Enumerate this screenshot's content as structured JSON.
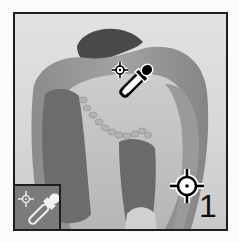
{
  "canvas": {
    "subject": "halved bell pepper (grayscale)",
    "colors": {
      "frame_border": "#1e1e1e",
      "background": "#dcdcdc",
      "pepper_dark": "#4a4a4a",
      "pepper_mid": "#8a8a8a",
      "pepper_light": "#c8c8c8",
      "inset_bg": "#7b7b7b"
    }
  },
  "cursor": {
    "icon": "color-sampler-eyedropper-icon"
  },
  "sampler_point": {
    "icon": "crosshair-target-icon",
    "label": "1"
  },
  "tool_inset": {
    "icon": "color-sampler-tool-icon"
  }
}
